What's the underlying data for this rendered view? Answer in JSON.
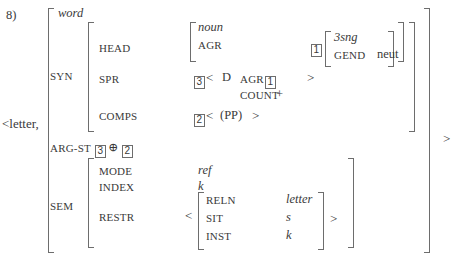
{
  "figure": {
    "number": "8)",
    "lexeme_list_open": "<letter,",
    "lexeme_list_close": ">",
    "type_label": "word"
  },
  "syn": {
    "label": "SYN",
    "head": {
      "label": "HEAD",
      "type": "noun",
      "agr_label": "AGR",
      "agr_tag": "1",
      "agr_value": {
        "type": "3sng",
        "gend_label": "GEND",
        "gend_value": "neut"
      }
    },
    "spr": {
      "label": "SPR",
      "tag": "3",
      "open": "<",
      "close": ">",
      "det": "D",
      "agr_label": "AGR",
      "agr_tag": "1",
      "count_label": "COUNT",
      "count_value": "+"
    },
    "comps": {
      "label": "COMPS",
      "tag": "2",
      "open": "<",
      "value": "(PP)",
      "close": ">"
    }
  },
  "arg_st": {
    "label": "ARG-ST",
    "first_tag": "3",
    "operator": "⊕",
    "second_tag": "2"
  },
  "sem": {
    "label": "SEM",
    "mode": {
      "label": "MODE",
      "value": "ref"
    },
    "index": {
      "label": "INDEX",
      "value": "k"
    },
    "restr": {
      "label": "RESTR",
      "open": "<",
      "close": ">",
      "rows": [
        {
          "feature": "RELN",
          "value": "letter",
          "italic": true
        },
        {
          "feature": "SIT",
          "value": "s",
          "italic": true
        },
        {
          "feature": "INST",
          "value": "k",
          "italic": true
        }
      ]
    }
  }
}
